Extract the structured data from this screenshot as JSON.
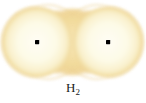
{
  "figure": {
    "label": {
      "element": "H",
      "subscript": "2",
      "full": "H2"
    },
    "background_color": "#FFFFFF",
    "colors": {
      "lobe_fill_inner": "#FDFCF0",
      "lobe_fill_outer": "#F8EFC8",
      "overlap_gold": "#F2DA9A",
      "edge_tan": "#EFD79C",
      "nucleus": "#000000"
    },
    "orbitals": [
      {
        "name": "hydrogen-1s-left",
        "center_x": 37,
        "center_y": 42,
        "radius": 36
      },
      {
        "name": "hydrogen-1s-right",
        "center_x": 108,
        "center_y": 42,
        "radius": 36
      }
    ],
    "nuclei": [
      {
        "name": "nucleus-left",
        "x": 37,
        "y": 42,
        "size": 4
      },
      {
        "name": "nucleus-right",
        "x": 108,
        "y": 42,
        "size": 4
      }
    ],
    "overlap_region": {
      "name": "bonding-overlap",
      "x": 72,
      "y": 42,
      "width": 40,
      "height": 68
    }
  }
}
